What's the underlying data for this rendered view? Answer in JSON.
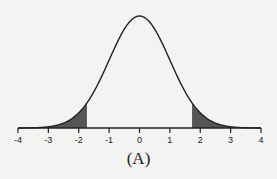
{
  "chart_data": {
    "type": "area",
    "title": "",
    "caption": "(A)",
    "xlabel": "",
    "ylabel": "",
    "xlim": [
      -4,
      4
    ],
    "x_ticks": [
      -4,
      -3,
      -2,
      -1,
      0,
      1,
      2,
      3,
      4
    ],
    "x_tick_labels": [
      "-4",
      "-3",
      "-2",
      "-1",
      "0",
      "1",
      "2",
      "3",
      "4"
    ],
    "curve": "standard normal density",
    "mean": 0,
    "sd": 1,
    "shaded_regions": [
      {
        "from": -4,
        "to": -1.73,
        "label": "left tail"
      },
      {
        "from": 1.73,
        "to": 4,
        "label": "right tail"
      }
    ],
    "grid": false,
    "legend": null
  },
  "colors": {
    "background": "#f3f3f1",
    "curve": "#222222",
    "shade": "#555555",
    "axis": "#222222"
  }
}
